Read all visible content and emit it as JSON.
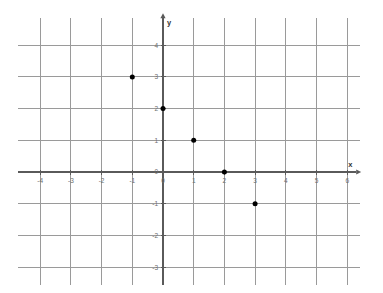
{
  "figure": {
    "kind": "coordinate-plane",
    "background_color": "#ffffff",
    "grid_color": "#9a9a9a",
    "axis_color": "#5a5a5a",
    "point_color": "#000000",
    "tick_label_color": "#6e6e6e"
  },
  "axes": {
    "x_label": "x",
    "y_label": "y",
    "x_ticks": [
      "-4",
      "-3",
      "-2",
      "-1",
      "0",
      "1",
      "2",
      "3",
      "4",
      "5",
      "6"
    ],
    "y_ticks": [
      "4",
      "3",
      "2",
      "1",
      "0",
      "-1",
      "-2",
      "-3"
    ],
    "origin_label": "0"
  },
  "chart_data": {
    "type": "scatter",
    "title": "",
    "subtitle": "",
    "xlabel": "x",
    "ylabel": "y",
    "xlim": [
      -4,
      6
    ],
    "ylim": [
      -3,
      4
    ],
    "xticks": [
      -4,
      -3,
      -2,
      -1,
      0,
      1,
      2,
      3,
      4,
      5,
      6
    ],
    "yticks": [
      -3,
      -2,
      -1,
      0,
      1,
      2,
      3,
      4
    ],
    "grid": true,
    "legend": null,
    "legend_position": "none",
    "marker": "filled-circle",
    "marker_color": "#000000",
    "marker_size_px": 5,
    "series": [
      {
        "name": "plotted points",
        "points": [
          {
            "x": -1,
            "y": 3,
            "label": "(-1, 3)"
          },
          {
            "x": 0,
            "y": 2,
            "label": "(0, 2)"
          },
          {
            "x": 1,
            "y": 1,
            "label": "(1, 1)"
          },
          {
            "x": 2,
            "y": 0,
            "label": "(2, 0)"
          },
          {
            "x": 3,
            "y": -1,
            "label": "(3, -1)"
          }
        ]
      }
    ],
    "annotations": []
  }
}
